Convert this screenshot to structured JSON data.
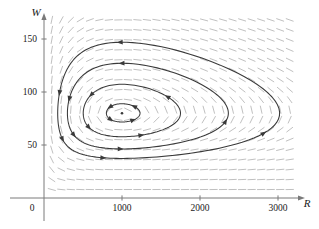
{
  "figure": {
    "kind": "phase-portrait-direction-field",
    "caption": ""
  },
  "axes": {
    "x": {
      "label": "R",
      "ticks": [
        {
          "value": 1000,
          "label": "1000"
        },
        {
          "value": 2000,
          "label": "2000"
        },
        {
          "value": 3000,
          "label": "3000"
        }
      ],
      "min": 0,
      "max": 3400,
      "origin_label": "0"
    },
    "y": {
      "label": "W",
      "ticks": [
        {
          "value": 50,
          "label": "50"
        },
        {
          "value": 100,
          "label": "100"
        },
        {
          "value": 150,
          "label": "150"
        }
      ],
      "min": 0,
      "max": 175
    }
  },
  "colors": {
    "axis": "#7a7a7a",
    "field": "#b9b9b9",
    "trajectory": "#3a3a3a",
    "text": "#1a1a1a",
    "background": "#ffffff"
  },
  "chart_data": {
    "type": "line",
    "title": "",
    "xlabel": "R",
    "ylabel": "W",
    "xlim": [
      0,
      3400
    ],
    "ylim": [
      0,
      175
    ],
    "grid": false,
    "legend": null,
    "equilibrium": {
      "R": 1000,
      "W": 80,
      "marker": "dot"
    },
    "direction_field": {
      "style": "dashes",
      "color": "#b9b9b9",
      "x_range": [
        100,
        3150
      ],
      "y_range": [
        8,
        168
      ],
      "nx": 26,
      "ny": 18,
      "model": "lotka-volterra",
      "params": {
        "a": 0.08,
        "b": 0.001,
        "c": 0.02,
        "d": 2e-05
      }
    },
    "series": [
      {
        "name": "orbit-1",
        "closed": true,
        "amplitude": 0.18,
        "arrow_count": 4,
        "direction": "counterclockwise",
        "extent": {
          "R": [
            820,
            1280
          ],
          "W": [
            68,
            92
          ]
        }
      },
      {
        "name": "orbit-2",
        "closed": true,
        "amplitude": 0.55,
        "arrow_count": 4,
        "direction": "counterclockwise",
        "extent": {
          "R": [
            560,
            1720
          ],
          "W": [
            57,
            103
          ]
        }
      },
      {
        "name": "orbit-3",
        "closed": true,
        "amplitude": 0.95,
        "arrow_count": 5,
        "direction": "counterclockwise",
        "extent": {
          "R": [
            390,
            2150
          ],
          "W": [
            47,
            120
          ]
        }
      },
      {
        "name": "orbit-4",
        "closed": true,
        "amplitude": 1.35,
        "arrow_count": 5,
        "direction": "counterclockwise",
        "extent": {
          "R": [
            250,
            2840
          ],
          "W": [
            40,
            140
          ]
        }
      }
    ]
  }
}
